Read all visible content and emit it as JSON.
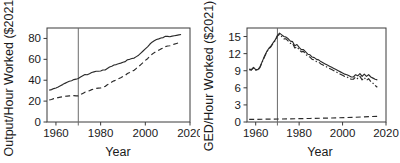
{
  "figure": {
    "background": "#ffffff",
    "line_color": "#2b2b2b",
    "panel_count": 2
  },
  "chart_data": [
    {
      "type": "line",
      "panel": "left",
      "title": "",
      "xlabel": "Year",
      "ylabel": "Output/Hour Worked ($2021)",
      "xlim": [
        1956,
        2020
      ],
      "ylim": [
        0,
        90
      ],
      "xticks": [
        1960,
        1980,
        2000,
        2020
      ],
      "yticks": [
        0,
        20,
        40,
        60,
        80
      ],
      "grid": false,
      "legend": "none",
      "annotations": [
        {
          "type": "vline",
          "x": 1970,
          "label": ""
        }
      ],
      "series": [
        {
          "name": "solid-series",
          "style": "solid",
          "x": [
            1957,
            1958,
            1959,
            1960,
            1961,
            1962,
            1963,
            1964,
            1965,
            1966,
            1967,
            1968,
            1969,
            1970,
            1971,
            1972,
            1973,
            1974,
            1975,
            1976,
            1977,
            1978,
            1979,
            1980,
            1981,
            1982,
            1983,
            1984,
            1985,
            1986,
            1987,
            1988,
            1989,
            1990,
            1991,
            1992,
            1993,
            1994,
            1995,
            1996,
            1997,
            1998,
            1999,
            2000,
            2001,
            2002,
            2003,
            2004,
            2005,
            2006,
            2007,
            2008,
            2009,
            2010,
            2011,
            2012,
            2013,
            2014,
            2015,
            2016
          ],
          "y": [
            30.5,
            31.0,
            32.0,
            32.6,
            33.6,
            34.8,
            35.8,
            37.0,
            38.0,
            39.0,
            39.5,
            40.6,
            41.0,
            41.6,
            43.0,
            44.2,
            45.4,
            45.2,
            46.2,
            47.4,
            48.0,
            48.6,
            48.6,
            48.8,
            49.8,
            49.8,
            51.2,
            52.6,
            53.4,
            54.6,
            55.0,
            55.8,
            56.4,
            57.2,
            57.8,
            59.6,
            60.0,
            60.8,
            61.2,
            62.6,
            64.0,
            66.0,
            68.0,
            70.0,
            72.0,
            74.4,
            76.4,
            77.8,
            79.0,
            79.6,
            80.4,
            80.8,
            82.0,
            82.0,
            81.6,
            82.2,
            82.6,
            83.0,
            83.4,
            83.8
          ]
        },
        {
          "name": "dashed-series",
          "style": "dashed",
          "x": [
            1957,
            1958,
            1959,
            1960,
            1961,
            1962,
            1963,
            1964,
            1965,
            1966,
            1967,
            1968,
            1969,
            1970,
            1971,
            1972,
            1973,
            1974,
            1975,
            1976,
            1977,
            1978,
            1979,
            1980,
            1981,
            1982,
            1983,
            1984,
            1985,
            1986,
            1987,
            1988,
            1989,
            1990,
            1991,
            1992,
            1993,
            1994,
            1995,
            1996,
            1997,
            1998,
            1999,
            2000,
            2001,
            2002,
            2003,
            2004,
            2005,
            2006,
            2007,
            2008,
            2009,
            2010,
            2011,
            2012,
            2013,
            2014,
            2015,
            2016
          ],
          "y": [
            21.0,
            21.6,
            22.4,
            22.8,
            23.4,
            23.8,
            24.2,
            24.6,
            24.8,
            25.0,
            25.2,
            25.2,
            25.0,
            25.0,
            26.2,
            27.4,
            28.6,
            29.0,
            30.0,
            31.0,
            31.6,
            32.2,
            32.4,
            32.6,
            33.6,
            34.0,
            35.6,
            37.0,
            38.2,
            39.4,
            40.2,
            41.4,
            42.4,
            43.6,
            44.6,
            46.4,
            47.4,
            48.6,
            49.6,
            51.4,
            53.0,
            55.0,
            57.0,
            59.0,
            60.6,
            62.8,
            64.8,
            66.4,
            67.8,
            68.8,
            70.0,
            70.8,
            72.2,
            72.8,
            73.0,
            73.8,
            74.6,
            75.2,
            75.8,
            76.4
          ]
        }
      ]
    },
    {
      "type": "line",
      "panel": "right",
      "title": "",
      "xlabel": "Year",
      "ylabel": "GED/Hour Worked ($2021)",
      "xlim": [
        1956,
        2020
      ],
      "ylim": [
        0,
        16.5
      ],
      "xticks": [
        1960,
        1980,
        2000,
        2020
      ],
      "yticks": [
        0,
        3,
        6,
        9,
        12,
        15
      ],
      "grid": false,
      "legend": "none",
      "annotations": [
        {
          "type": "vline",
          "x": 1970,
          "label": ""
        }
      ],
      "series": [
        {
          "name": "solid-series",
          "style": "solid",
          "x": [
            1957,
            1958,
            1959,
            1960,
            1961,
            1962,
            1963,
            1964,
            1965,
            1966,
            1967,
            1968,
            1969,
            1970,
            1971,
            1972,
            1973,
            1974,
            1975,
            1976,
            1977,
            1978,
            1979,
            1980,
            1981,
            1982,
            1983,
            1984,
            1985,
            1986,
            1987,
            1988,
            1989,
            1990,
            1991,
            1992,
            1993,
            1994,
            1995,
            1996,
            1997,
            1998,
            1999,
            2000,
            2001,
            2002,
            2003,
            2004,
            2005,
            2006,
            2007,
            2008,
            2009,
            2010,
            2011,
            2012,
            2013,
            2014,
            2015,
            2016
          ],
          "y": [
            9.3,
            9.2,
            9.6,
            9.2,
            9.2,
            9.7,
            10.6,
            11.5,
            12.3,
            12.9,
            13.3,
            13.9,
            14.4,
            15.2,
            15.6,
            15.3,
            15.0,
            14.9,
            14.6,
            14.2,
            14.1,
            13.4,
            13.6,
            13.1,
            12.7,
            12.7,
            12.3,
            11.9,
            11.8,
            11.4,
            11.3,
            11.0,
            10.9,
            10.6,
            10.4,
            10.2,
            10.0,
            9.8,
            9.6,
            9.4,
            9.2,
            9.0,
            8.8,
            8.6,
            8.4,
            8.3,
            8.1,
            7.9,
            7.9,
            8.3,
            8.1,
            8.5,
            8.0,
            8.4,
            8.0,
            8.3,
            7.9,
            7.7,
            7.5,
            7.4
          ]
        },
        {
          "name": "dashdot-series",
          "style": "dashdot",
          "x": [
            1957,
            1958,
            1959,
            1960,
            1961,
            1962,
            1963,
            1964,
            1965,
            1966,
            1967,
            1968,
            1969,
            1970,
            1971,
            1972,
            1973,
            1974,
            1975,
            1976,
            1977,
            1978,
            1979,
            1980,
            1981,
            1982,
            1983,
            1984,
            1985,
            1986,
            1987,
            1988,
            1989,
            1990,
            1991,
            1992,
            1993,
            1994,
            1995,
            1996,
            1997,
            1998,
            1999,
            2000,
            2001,
            2002,
            2003,
            2004,
            2005,
            2006,
            2007,
            2008,
            2009,
            2010,
            2011,
            2012,
            2013,
            2014,
            2015,
            2016
          ],
          "y": [
            9.2,
            9.1,
            9.5,
            9.1,
            9.1,
            9.6,
            10.5,
            11.4,
            12.2,
            12.8,
            13.2,
            13.8,
            14.3,
            15.1,
            15.4,
            15.0,
            14.6,
            14.6,
            14.2,
            13.8,
            13.8,
            13.0,
            13.2,
            12.7,
            12.3,
            12.4,
            11.9,
            11.5,
            11.4,
            11.0,
            10.9,
            10.6,
            10.5,
            10.2,
            10.0,
            9.8,
            9.6,
            9.4,
            9.2,
            9.0,
            8.8,
            8.6,
            8.4,
            8.2,
            8.0,
            7.9,
            7.7,
            7.5,
            7.5,
            7.9,
            7.6,
            8.0,
            7.4,
            7.8,
            7.3,
            7.6,
            7.1,
            6.8,
            6.4,
            6.1
          ]
        },
        {
          "name": "flat-dashed-series",
          "style": "dashed",
          "x": [
            1957,
            1965,
            1975,
            1985,
            1995,
            2005,
            2010,
            2016
          ],
          "y": [
            0.45,
            0.5,
            0.55,
            0.62,
            0.7,
            0.82,
            0.9,
            1.0
          ]
        }
      ]
    }
  ]
}
